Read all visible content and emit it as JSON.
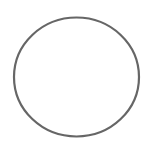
{
  "shape": {
    "type": "circle",
    "cx": 76.5,
    "cy": 77,
    "rx": 62.5,
    "ry": 59.5,
    "stroke": "#666666",
    "stroke_width": 2.2,
    "fill": "none"
  }
}
